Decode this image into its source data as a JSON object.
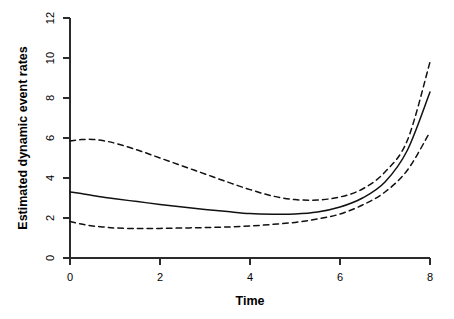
{
  "chart_data": {
    "type": "line",
    "title": "",
    "xlabel": "Time",
    "ylabel": "Estimated dynamic event rates",
    "xlim": [
      0,
      8
    ],
    "ylim": [
      0,
      12
    ],
    "xticks": [
      0,
      2,
      4,
      6,
      8
    ],
    "yticks": [
      0,
      2,
      4,
      6,
      8,
      10,
      12
    ],
    "xtick_labels": [
      "0",
      "2",
      "4",
      "6",
      "8"
    ],
    "ytick_labels": [
      "0",
      "2",
      "4",
      "6",
      "8",
      "10",
      "12"
    ],
    "grid": false,
    "legend": null,
    "axis_style": "r-base-l-box",
    "x": [
      0.0,
      0.25,
      0.5,
      0.75,
      1.0,
      1.5,
      2.0,
      2.5,
      3.0,
      3.5,
      4.0,
      4.5,
      5.0,
      5.5,
      6.0,
      6.5,
      7.0,
      7.5,
      8.0
    ],
    "series": [
      {
        "name": "Upper 95% confidence band",
        "style": "dashed",
        "values": [
          5.85,
          5.92,
          5.93,
          5.86,
          5.74,
          5.4,
          5.0,
          4.6,
          4.2,
          3.8,
          3.42,
          3.1,
          2.92,
          2.9,
          3.05,
          3.45,
          4.3,
          5.9,
          9.8
        ]
      },
      {
        "name": "Estimated dynamic event rate",
        "style": "solid",
        "values": [
          3.3,
          3.22,
          3.12,
          3.04,
          2.96,
          2.82,
          2.68,
          2.55,
          2.43,
          2.32,
          2.22,
          2.19,
          2.2,
          2.3,
          2.55,
          3.0,
          3.8,
          5.4,
          8.3
        ]
      },
      {
        "name": "Lower 95% confidence band",
        "style": "dashed",
        "values": [
          1.82,
          1.7,
          1.6,
          1.55,
          1.5,
          1.47,
          1.48,
          1.5,
          1.52,
          1.55,
          1.6,
          1.68,
          1.78,
          1.95,
          2.2,
          2.65,
          3.3,
          4.4,
          6.3
        ]
      }
    ],
    "colors": {
      "line": "#111111",
      "axis": "#2b2b2b",
      "background": "#ffffff"
    }
  },
  "figure": {
    "xlabel": "Time",
    "ylabel": "Estimated dynamic event rates"
  }
}
